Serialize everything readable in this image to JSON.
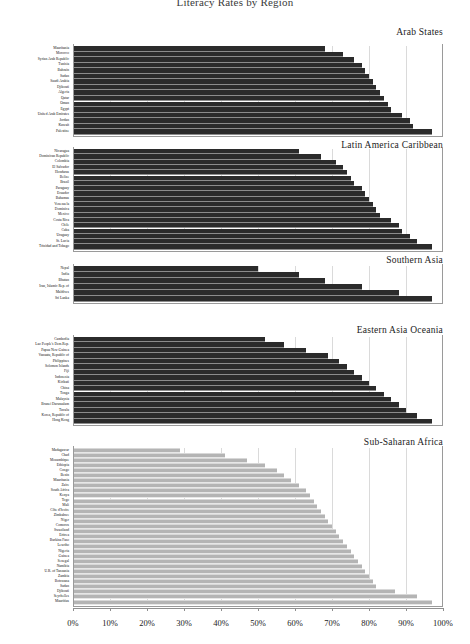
{
  "title": "Literacy Rates by Region",
  "axis": {
    "ticks": [
      "0%",
      "10%",
      "20%",
      "30%",
      "40%",
      "50%",
      "60%",
      "70%",
      "80%",
      "90%",
      "100%"
    ],
    "min": 0,
    "max": 100
  },
  "colors": {
    "dark_bar": "#2b2b2b",
    "light_bar": "#b4b4b4",
    "axis": "#9a9a9a",
    "text": "#1a1a1a"
  },
  "chart_data": {
    "type": "bar",
    "orientation": "horizontal",
    "title": "Literacy Rates by Region",
    "xlabel": "",
    "ylabel": "",
    "xlim": [
      0,
      100
    ],
    "grid": true,
    "legend": "none",
    "panels": [
      {
        "name": "Arab States",
        "style": "dark",
        "categories": [
          "Mauritania",
          "Morocco",
          "Syrian Arab Republic",
          "Tunisia",
          "Bahrain",
          "Sudan",
          "Saudi Arabia",
          "Djibouti",
          "Algeria",
          "Qatar",
          "Oman",
          "Egypt",
          "United Arab Emirates",
          "Jordan",
          "Kuwait",
          "Palestine"
        ],
        "values": [
          68,
          73,
          76,
          78,
          79,
          80,
          81,
          82,
          83,
          84,
          85,
          86,
          89,
          91,
          92,
          97
        ]
      },
      {
        "name": "Latin America Caribbean",
        "style": "dark",
        "categories": [
          "Nicaragua",
          "Dominican Republic",
          "Colombia",
          "El Salvador",
          "Honduras",
          "Belize",
          "Brazil",
          "Paraguay",
          "Ecuador",
          "Bahamas",
          "Venezuela",
          "Dominica",
          "Mexico",
          "Costa Rica",
          "Chile",
          "Cuba",
          "Uruguay",
          "St. Lucia",
          "Trinidad and Tobago"
        ],
        "values": [
          61,
          67,
          71,
          73,
          74,
          75,
          76,
          78,
          79,
          80,
          81,
          82,
          83,
          86,
          88,
          89,
          91,
          93,
          97
        ]
      },
      {
        "name": "Southern Asia",
        "style": "dark",
        "categories": [
          "Nepal",
          "India",
          "Bhutan",
          "Iran, Islamic Rep. of",
          "Maldives",
          "Sri Lanka"
        ],
        "values": [
          50,
          61,
          68,
          78,
          88,
          97
        ]
      },
      {
        "name": "Eastern Asia Oceania",
        "style": "dark",
        "categories": [
          "Cambodia",
          "Lao People's Dem.Rep.",
          "Papua New Guinea",
          "Vanuatu, Republic of",
          "Philippines",
          "Solomon Islands",
          "Fiji",
          "Indonesia",
          "Kiribati",
          "China",
          "Tonga",
          "Malaysia",
          "Brunei Darussalam",
          "Tuvalu",
          "Korea, Republic of",
          "Hong Kong"
        ],
        "values": [
          52,
          57,
          63,
          69,
          72,
          74,
          76,
          78,
          80,
          82,
          84,
          86,
          88,
          90,
          93,
          97
        ]
      },
      {
        "name": "Sub-Saharan Africa",
        "style": "light",
        "categories": [
          "Madagascar",
          "Chad",
          "Mozambique",
          "Ethiopia",
          "Congo",
          "Benin",
          "Mauritania",
          "Zaire",
          "South Africa",
          "Kenya",
          "Togo",
          "Mali",
          "Côte d'Ivoire",
          "Zimbabwe",
          "Niger",
          "Comoros",
          "Swaziland",
          "Eritrea",
          "Burkina Faso",
          "Lesotho",
          "Nigeria",
          "Guinea",
          "Senegal",
          "Namibia",
          "U.R. of Tanzania",
          "Zambia",
          "Botswana",
          "Sudan",
          "Djibouti",
          "Seychelles",
          "Mauritius"
        ],
        "values": [
          29,
          41,
          47,
          52,
          55,
          57,
          59,
          61,
          63,
          64,
          65,
          66,
          67,
          68,
          69,
          70,
          71,
          72,
          73,
          74,
          75,
          76,
          77,
          78,
          79,
          80,
          81,
          82,
          87,
          93,
          97
        ]
      }
    ]
  }
}
